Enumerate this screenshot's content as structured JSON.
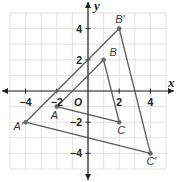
{
  "diagram": {
    "type": "coordinate-plane-dilation",
    "axes": {
      "x_label": "x",
      "y_label": "y",
      "origin_label": "O",
      "x_ticks": [
        {
          "value": -4,
          "label": "−4"
        },
        {
          "value": -2,
          "label": "−2"
        },
        {
          "value": 2,
          "label": "2"
        },
        {
          "value": 4,
          "label": "4"
        }
      ],
      "y_ticks": [
        {
          "value": 4,
          "label": "4"
        },
        {
          "value": 2,
          "label": "2"
        },
        {
          "value": -2,
          "label": "−2"
        },
        {
          "value": -4,
          "label": "−4"
        }
      ],
      "range": {
        "x": [
          -5,
          5
        ],
        "y": [
          -5,
          5
        ]
      }
    },
    "triangles": [
      {
        "name": "ABC",
        "vertices": [
          {
            "label": "A",
            "x": -2,
            "y": -1
          },
          {
            "label": "B",
            "x": 1,
            "y": 2
          },
          {
            "label": "C",
            "x": 2,
            "y": -2
          }
        ]
      },
      {
        "name": "A'B'C'",
        "vertices": [
          {
            "label": "A′",
            "x": -4,
            "y": -2
          },
          {
            "label": "B′",
            "x": 2,
            "y": 4
          },
          {
            "label": "C′",
            "x": 4,
            "y": -4
          }
        ]
      }
    ],
    "colors": {
      "grid": "#d9d9d9",
      "axis": "#222222",
      "triangle": "#5a5a5a",
      "point": "#6a6a6a"
    }
  }
}
